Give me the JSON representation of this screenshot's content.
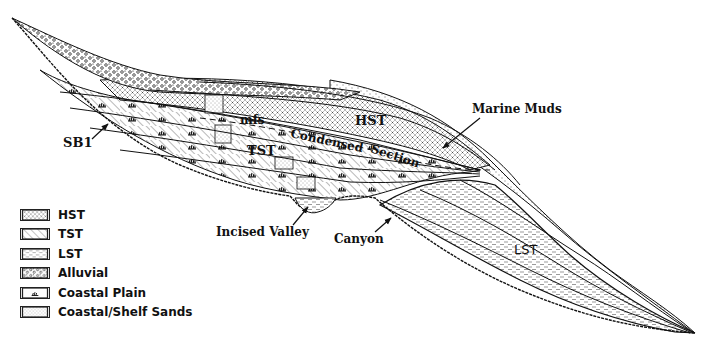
{
  "diagram": {
    "labels": {
      "sb1": "SB1",
      "hst": "HST",
      "tst": "TST",
      "lst": "LST",
      "mfs": "mfs",
      "condensed": "Condensed",
      "section": "Section",
      "marine_muds": "Marine Muds",
      "incised_valley": "Incised Valley",
      "canyon": "Canyon"
    }
  },
  "legend": {
    "items": [
      {
        "key": "hst",
        "label": "HST",
        "pattern": "dotted-cross"
      },
      {
        "key": "tst",
        "label": "TST",
        "pattern": "diagonal-hatch"
      },
      {
        "key": "lst",
        "label": "LST",
        "pattern": "dashes"
      },
      {
        "key": "alluvial",
        "label": "Alluvial",
        "pattern": "circles"
      },
      {
        "key": "coastal_plain",
        "label": "Coastal Plain",
        "pattern": "grass-tuft"
      },
      {
        "key": "coastal_shelf_sands",
        "label": "Coastal/Shelf Sands",
        "pattern": "stipple"
      }
    ]
  },
  "colors": {
    "ink": "#111111",
    "background": "#ffffff"
  }
}
